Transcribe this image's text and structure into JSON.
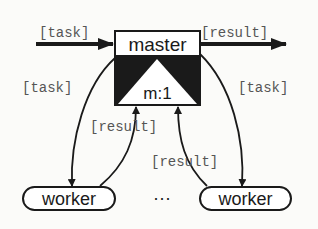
{
  "diagram": {
    "type": "master-worker",
    "colors": {
      "ink": "#1a1a1a",
      "label": "#555555",
      "background": "#fbfbf9"
    },
    "master": {
      "label": "master",
      "ratio_label": "m:1"
    },
    "workers": [
      {
        "label": "worker"
      },
      {
        "label": "worker"
      }
    ],
    "ellipsis": "···",
    "edges": {
      "input_label": "[task]",
      "output_label": "[result]",
      "left_task_label": "[task]",
      "left_result_label": "[result]",
      "right_task_label": "[task]",
      "right_result_label": "[result]"
    }
  }
}
